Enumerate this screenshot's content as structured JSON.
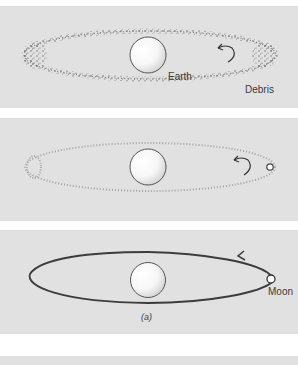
{
  "figure": {
    "panels": [
      {
        "id": "debris-ring",
        "labels": {
          "planet": "Earth",
          "ring": "Debris"
        },
        "ring_style": "dense-debris"
      },
      {
        "id": "thin-ring-forming-moon",
        "labels": {},
        "ring_style": "sparse-debris"
      },
      {
        "id": "moon-orbit",
        "labels": {
          "satellite": "Moon",
          "caption": "(a)"
        },
        "ring_style": "solid-orbit"
      },
      {
        "id": "next-panel",
        "labels": {}
      }
    ]
  },
  "colors": {
    "panel_bg": "#e1e1e1",
    "page_bg": "#ffffff",
    "orbit_line": "#3c3c3c",
    "debris": "#555555",
    "label_text": "#3a3a3a"
  }
}
